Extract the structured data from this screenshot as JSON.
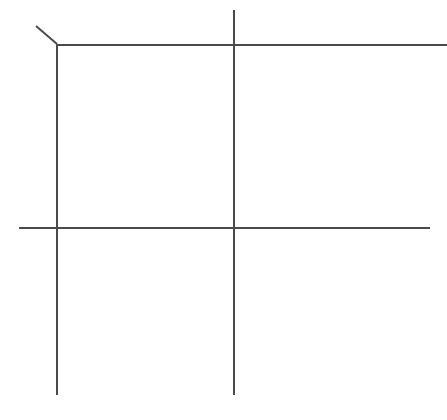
{
  "canvas": {
    "width": 447,
    "height": 420,
    "background_color": "#ffffff",
    "title": "Line sketch of an intersecting grid frame"
  },
  "style": {
    "stroke_color": "#4a4a4a",
    "stroke_width": 2,
    "stroke_width_thin": 1.8
  },
  "drawing": {
    "type": "line-sketch",
    "description": "Four long straight strokes forming an open grid: two vertical lines crossed by two horizontal lines, with a short diagonal stub at the upper-left corner vertex.",
    "strokes": [
      {
        "name": "diagonal-corner-stub",
        "kind": "line",
        "x1": 36,
        "y1": 26,
        "x2": 57,
        "y2": 44,
        "width": 2
      },
      {
        "name": "vertical-left",
        "kind": "line",
        "x1": 57,
        "y1": 44,
        "x2": 57,
        "y2": 395,
        "width": 2
      },
      {
        "name": "vertical-middle",
        "kind": "line",
        "x1": 234,
        "y1": 10,
        "x2": 234,
        "y2": 395,
        "width": 2
      },
      {
        "name": "horizontal-top",
        "kind": "line",
        "x1": 57,
        "y1": 45,
        "x2": 447,
        "y2": 45,
        "width": 2
      },
      {
        "name": "horizontal-lower",
        "kind": "line",
        "x1": 19,
        "y1": 228,
        "x2": 430,
        "y2": 228,
        "width": 2
      }
    ],
    "intersections": [
      {
        "name": "corner-vertex-top-left",
        "x": 57,
        "y": 44
      },
      {
        "name": "crossing-top-middle",
        "x": 234,
        "y": 45
      },
      {
        "name": "crossing-left-lower",
        "x": 57,
        "y": 228
      },
      {
        "name": "crossing-middle-lower",
        "x": 234,
        "y": 228
      }
    ]
  }
}
